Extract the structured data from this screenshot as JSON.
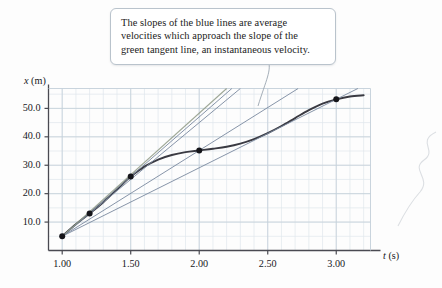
{
  "figure": {
    "callout": {
      "line1": "The slopes of the blue lines are average",
      "line2": "velocities which approach the slope of the",
      "line3": "green tangent line, an instantaneous velocity."
    }
  },
  "chart_data": {
    "type": "line",
    "title": "",
    "xlabel": "t (s)",
    "ylabel": "x (m)",
    "xlim": [
      0.9,
      3.25
    ],
    "ylim": [
      0.0,
      57.0
    ],
    "grid": true,
    "legend": "none",
    "xticks": [
      "1.00",
      "1.50",
      "2.00",
      "2.50",
      "3.00"
    ],
    "xtick_values": [
      1.0,
      1.5,
      2.0,
      2.5,
      3.0
    ],
    "yticks": [
      "10.0",
      "20.0",
      "30.0",
      "40.0",
      "50.0"
    ],
    "ytick_values": [
      10.0,
      20.0,
      30.0,
      40.0,
      50.0
    ],
    "x_minor_step": 0.1,
    "y_minor_step": 5.0,
    "series": [
      {
        "name": "position curve",
        "type": "curve",
        "color": "#3a3a42",
        "x": [
          1.0,
          1.1,
          1.2,
          1.3,
          1.4,
          1.5,
          1.6,
          1.7,
          1.8,
          1.9,
          2.0,
          2.1,
          2.2,
          2.3,
          2.4,
          2.5,
          2.6,
          2.7,
          2.8,
          2.9,
          3.0,
          3.1,
          3.2
        ],
        "y": [
          5.0,
          9.2,
          13.0,
          17.0,
          21.5,
          26.0,
          29.5,
          32.0,
          33.6,
          34.6,
          35.2,
          35.8,
          36.5,
          37.6,
          39.2,
          41.3,
          43.8,
          46.6,
          49.4,
          51.7,
          53.2,
          54.2,
          54.6
        ]
      },
      {
        "name": "secant line to t=3.00",
        "type": "secant",
        "color": "#7b8aa0",
        "x": [
          1.0,
          3.0
        ],
        "y": [
          5.0,
          53.2
        ]
      },
      {
        "name": "secant line to t=2.00",
        "type": "secant",
        "color": "#7b8aa0",
        "x": [
          1.0,
          2.0
        ],
        "y": [
          5.0,
          35.2
        ]
      },
      {
        "name": "secant line to t=1.50",
        "type": "secant",
        "color": "#7b8aa0",
        "x": [
          1.0,
          1.5
        ],
        "y": [
          5.0,
          26.0
        ]
      },
      {
        "name": "secant line to t=1.20",
        "type": "secant",
        "color": "#7b8aa0",
        "x": [
          1.0,
          1.2
        ],
        "y": [
          5.0,
          13.0
        ]
      },
      {
        "name": "tangent line at t=1.00",
        "type": "tangent",
        "color": "#8f9a86",
        "x": [
          1.0,
          2.2
        ],
        "y": [
          5.0,
          57.0
        ]
      }
    ],
    "points": [
      {
        "label": "t=1.00",
        "x": 1.0,
        "y": 5.0
      },
      {
        "label": "t=1.20",
        "x": 1.2,
        "y": 13.0
      },
      {
        "label": "t=1.50",
        "x": 1.5,
        "y": 26.0
      },
      {
        "label": "t=2.00",
        "x": 2.0,
        "y": 35.2
      },
      {
        "label": "t=3.00",
        "x": 3.0,
        "y": 53.2
      }
    ]
  }
}
